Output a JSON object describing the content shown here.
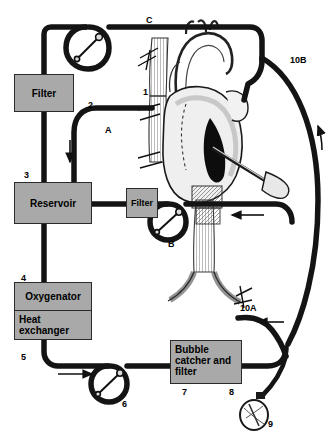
{
  "figure": {
    "type": "medical-schematic",
    "background": "#ffffff",
    "tubing_color": "#1a1a1a",
    "box_fill": "#a9a9a9",
    "box_border": "#2b2b2b"
  },
  "components": {
    "arterial_filter": {
      "label": "Filter",
      "number": ""
    },
    "reservoir": {
      "label": "Reservoir",
      "number": "3"
    },
    "cardiotomy_filter": {
      "label": "Filter",
      "number": ""
    },
    "oxygenator": {
      "label": "Oxygenator",
      "number": "4"
    },
    "heat_exchanger": {
      "label": "Heat\nexchanger",
      "line1": "Heat",
      "line2": "exchanger",
      "number": "5"
    },
    "bubble_catcher": {
      "line1": "Bubble",
      "line2": "catcher and",
      "line3": "filter",
      "number_left": "7",
      "number_right": "8"
    }
  },
  "callouts": [
    {
      "id": "c-1",
      "text": "1",
      "x": 143,
      "y": 88
    },
    {
      "id": "c-2",
      "text": "2",
      "x": 88,
      "y": 101
    },
    {
      "id": "c-3",
      "text": "3",
      "x": 24,
      "y": 171
    },
    {
      "id": "c-4",
      "text": "4",
      "x": 21,
      "y": 274
    },
    {
      "id": "c-5",
      "text": "5",
      "x": 21,
      "y": 353
    },
    {
      "id": "c-6",
      "text": "6",
      "x": 122,
      "y": 400
    },
    {
      "id": "c-7",
      "text": "7",
      "x": 182,
      "y": 388
    },
    {
      "id": "c-8",
      "text": "8",
      "x": 229,
      "y": 388
    },
    {
      "id": "c-9",
      "text": "9",
      "x": 268,
      "y": 420
    },
    {
      "id": "c-10A",
      "text": "10A",
      "x": 240,
      "y": 304
    },
    {
      "id": "c-10B",
      "text": "10B",
      "x": 290,
      "y": 56
    },
    {
      "id": "c-A",
      "text": "A",
      "x": 105,
      "y": 126
    },
    {
      "id": "c-B",
      "text": "B",
      "x": 168,
      "y": 240
    },
    {
      "id": "c-C",
      "text": "C",
      "x": 146,
      "y": 16
    }
  ],
  "flow_arrows": [
    {
      "id": "arrow-reservoir-inlet",
      "direction": "down",
      "x": 70,
      "y": 150
    },
    {
      "id": "arrow-bottom-left",
      "direction": "right",
      "x": 72,
      "y": 372
    },
    {
      "id": "arrow-venous-return",
      "direction": "left",
      "x": 250,
      "y": 215
    },
    {
      "id": "arrow-10A-return",
      "direction": "left",
      "x": 272,
      "y": 325
    },
    {
      "id": "arrow-10B-arc",
      "direction": "up",
      "x": 320,
      "y": 135
    }
  ],
  "pumps": [
    {
      "id": "pump-C",
      "label": "C",
      "kind": "roller-pump-loop"
    },
    {
      "id": "pump-B",
      "label": "B",
      "kind": "roller-pump-loop"
    },
    {
      "id": "pump-6",
      "label": "6",
      "kind": "roller-pump-loop"
    }
  ],
  "anatomy": {
    "name": "heart-and-great-vessels",
    "parts": [
      "aorta",
      "superior-vena-cava",
      "inferior-vena-cava",
      "right-atrium",
      "left-ventricle",
      "aortic-cannula",
      "venous-cannula",
      "vent-cannula"
    ]
  },
  "reservoir_bulb": {
    "id": "bulb-9",
    "number": "9"
  }
}
